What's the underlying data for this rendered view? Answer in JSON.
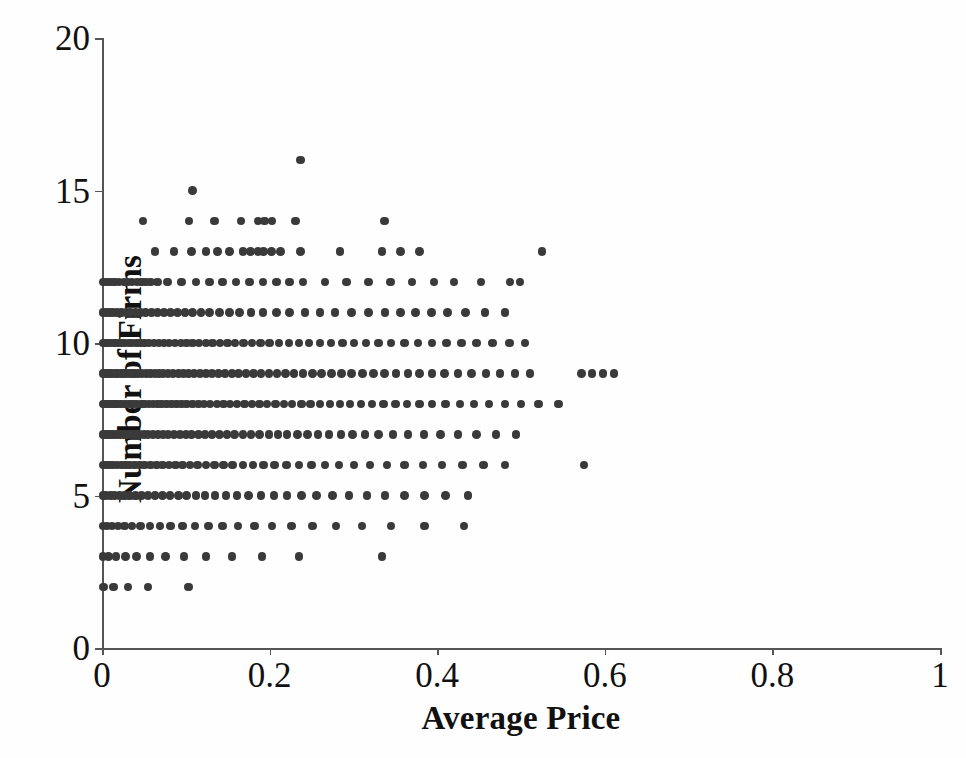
{
  "chart_data": {
    "type": "scatter",
    "title": "",
    "xlabel": "Average Price",
    "ylabel": "Number of Firms",
    "xlim": [
      0,
      1
    ],
    "ylim": [
      0,
      20
    ],
    "xticks": [
      0,
      0.2,
      0.4,
      0.6,
      0.8,
      1
    ],
    "xtick_labels": [
      "0",
      "0.2",
      "0.4",
      "0.6",
      "0.8",
      "1"
    ],
    "yticks": [
      0,
      5,
      10,
      15,
      20
    ],
    "ytick_labels": [
      "0",
      "5",
      "10",
      "15",
      "20"
    ],
    "grid": false,
    "legend": null,
    "marker": {
      "shape": "circle",
      "color": "#3a3a3a",
      "size_px": 8.5
    },
    "series": [
      {
        "name": "observations",
        "points_by_firm_count": [
          {
            "firms": 16,
            "prices": [
              0.237
            ]
          },
          {
            "firms": 15,
            "prices": [
              0.108
            ]
          },
          {
            "firms": 14,
            "prices": [
              0.049,
              0.104,
              0.134,
              0.166,
              0.186,
              0.194,
              0.203,
              0.231,
              0.337
            ]
          },
          {
            "firms": 13,
            "prices": [
              0.063,
              0.086,
              0.107,
              0.124,
              0.138,
              0.152,
              0.168,
              0.177,
              0.186,
              0.193,
              0.202,
              0.213,
              0.237,
              0.284,
              0.334,
              0.356,
              0.379,
              0.525
            ]
          },
          {
            "firms": 12,
            "prices": [
              0.002,
              0.006,
              0.01,
              0.015,
              0.02,
              0.026,
              0.031,
              0.036,
              0.042,
              0.047,
              0.052,
              0.058,
              0.066,
              0.078,
              0.095,
              0.112,
              0.128,
              0.144,
              0.16,
              0.176,
              0.192,
              0.208,
              0.224,
              0.24,
              0.266,
              0.292,
              0.318,
              0.344,
              0.37,
              0.396,
              0.42,
              0.452,
              0.487,
              0.499
            ]
          },
          {
            "firms": 11,
            "prices": [
              0.001,
              0.005,
              0.009,
              0.013,
              0.018,
              0.023,
              0.029,
              0.034,
              0.04,
              0.046,
              0.052,
              0.059,
              0.066,
              0.074,
              0.082,
              0.09,
              0.099,
              0.108,
              0.118,
              0.128,
              0.14,
              0.152,
              0.164,
              0.178,
              0.192,
              0.208,
              0.224,
              0.242,
              0.26,
              0.278,
              0.298,
              0.318,
              0.338,
              0.356,
              0.374,
              0.393,
              0.412,
              0.434,
              0.457,
              0.481
            ]
          },
          {
            "firms": 10,
            "prices": [
              0.001,
              0.004,
              0.007,
              0.011,
              0.015,
              0.019,
              0.023,
              0.027,
              0.032,
              0.036,
              0.041,
              0.046,
              0.051,
              0.056,
              0.062,
              0.068,
              0.074,
              0.08,
              0.087,
              0.094,
              0.101,
              0.108,
              0.116,
              0.124,
              0.132,
              0.141,
              0.15,
              0.159,
              0.169,
              0.179,
              0.189,
              0.2,
              0.211,
              0.223,
              0.235,
              0.247,
              0.26,
              0.273,
              0.287,
              0.301,
              0.315,
              0.33,
              0.345,
              0.361,
              0.377,
              0.394,
              0.411,
              0.429,
              0.447,
              0.466,
              0.486,
              0.505
            ]
          },
          {
            "firms": 9,
            "prices": [
              0.001,
              0.003,
              0.006,
              0.009,
              0.012,
              0.016,
              0.019,
              0.023,
              0.027,
              0.031,
              0.035,
              0.039,
              0.043,
              0.048,
              0.053,
              0.058,
              0.063,
              0.068,
              0.073,
              0.079,
              0.085,
              0.091,
              0.097,
              0.103,
              0.11,
              0.117,
              0.124,
              0.131,
              0.139,
              0.147,
              0.155,
              0.163,
              0.172,
              0.181,
              0.19,
              0.199,
              0.209,
              0.219,
              0.229,
              0.24,
              0.251,
              0.262,
              0.274,
              0.286,
              0.298,
              0.311,
              0.324,
              0.337,
              0.351,
              0.365,
              0.379,
              0.394,
              0.409,
              0.425,
              0.441,
              0.458,
              0.475,
              0.493,
              0.511,
              0.572,
              0.585,
              0.598,
              0.611
            ]
          },
          {
            "firms": 8,
            "prices": [
              0.001,
              0.003,
              0.006,
              0.009,
              0.012,
              0.015,
              0.018,
              0.022,
              0.026,
              0.03,
              0.034,
              0.038,
              0.042,
              0.047,
              0.051,
              0.056,
              0.061,
              0.066,
              0.071,
              0.077,
              0.083,
              0.089,
              0.095,
              0.101,
              0.108,
              0.115,
              0.122,
              0.129,
              0.137,
              0.145,
              0.153,
              0.161,
              0.17,
              0.179,
              0.188,
              0.197,
              0.207,
              0.217,
              0.227,
              0.238,
              0.249,
              0.26,
              0.272,
              0.284,
              0.296,
              0.309,
              0.322,
              0.336,
              0.35,
              0.364,
              0.379,
              0.394,
              0.41,
              0.427,
              0.444,
              0.462,
              0.481,
              0.5,
              0.521,
              0.545
            ]
          },
          {
            "firms": 7,
            "prices": [
              0.001,
              0.004,
              0.007,
              0.01,
              0.014,
              0.018,
              0.022,
              0.026,
              0.03,
              0.035,
              0.04,
              0.045,
              0.05,
              0.055,
              0.061,
              0.067,
              0.073,
              0.079,
              0.086,
              0.093,
              0.1,
              0.107,
              0.115,
              0.123,
              0.131,
              0.14,
              0.149,
              0.158,
              0.168,
              0.178,
              0.188,
              0.199,
              0.21,
              0.221,
              0.233,
              0.245,
              0.258,
              0.271,
              0.285,
              0.299,
              0.314,
              0.33,
              0.347,
              0.365,
              0.384,
              0.404,
              0.425,
              0.447,
              0.47,
              0.494
            ]
          },
          {
            "firms": 6,
            "prices": [
              0.001,
              0.005,
              0.009,
              0.013,
              0.018,
              0.023,
              0.028,
              0.033,
              0.039,
              0.045,
              0.051,
              0.058,
              0.065,
              0.072,
              0.08,
              0.088,
              0.096,
              0.105,
              0.114,
              0.124,
              0.134,
              0.145,
              0.156,
              0.168,
              0.18,
              0.193,
              0.206,
              0.22,
              0.235,
              0.25,
              0.266,
              0.283,
              0.301,
              0.32,
              0.34,
              0.361,
              0.383,
              0.406,
              0.43,
              0.455,
              0.481,
              0.575
            ]
          },
          {
            "firms": 5,
            "prices": [
              0.001,
              0.005,
              0.01,
              0.015,
              0.021,
              0.027,
              0.033,
              0.04,
              0.047,
              0.055,
              0.063,
              0.072,
              0.081,
              0.091,
              0.101,
              0.112,
              0.123,
              0.135,
              0.148,
              0.161,
              0.175,
              0.19,
              0.205,
              0.221,
              0.238,
              0.256,
              0.275,
              0.295,
              0.316,
              0.338,
              0.361,
              0.385,
              0.41,
              0.437
            ]
          },
          {
            "firms": 4,
            "prices": [
              0.001,
              0.006,
              0.012,
              0.019,
              0.027,
              0.036,
              0.046,
              0.057,
              0.069,
              0.082,
              0.096,
              0.111,
              0.127,
              0.144,
              0.162,
              0.182,
              0.203,
              0.226,
              0.251,
              0.279,
              0.31,
              0.345,
              0.385,
              0.432
            ]
          },
          {
            "firms": 3,
            "prices": [
              0.001,
              0.008,
              0.017,
              0.028,
              0.041,
              0.057,
              0.076,
              0.098,
              0.124,
              0.155,
              0.191,
              0.235,
              0.334
            ]
          },
          {
            "firms": 2,
            "prices": [
              0.002,
              0.014,
              0.031,
              0.055,
              0.103
            ]
          }
        ]
      }
    ]
  },
  "axes": {
    "x_title": "Average Price",
    "y_title": "Number of Firms"
  }
}
